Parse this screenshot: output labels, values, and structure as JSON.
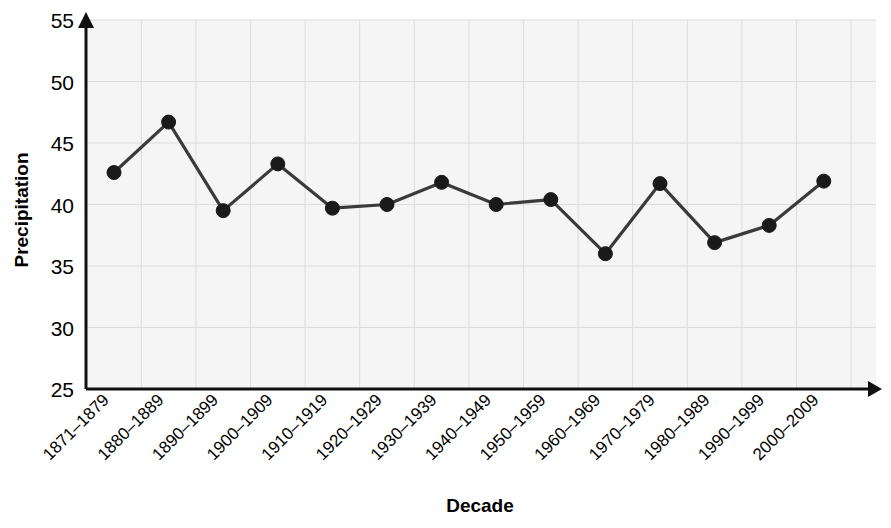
{
  "chart_data": {
    "type": "line",
    "title": "",
    "xlabel": "Decade",
    "ylabel": "Precipitation",
    "categories": [
      "1871–1879",
      "1880–1889",
      "1890–1899",
      "1900–1909",
      "1910–1919",
      "1920–1929",
      "1930–1939",
      "1940–1949",
      "1950–1959",
      "1960–1969",
      "1970–1979",
      "1980–1989",
      "1990–1999",
      "2000–2009"
    ],
    "values": [
      42.6,
      46.7,
      39.5,
      43.3,
      39.7,
      40.0,
      41.8,
      40.0,
      40.4,
      36.0,
      41.7,
      36.9,
      38.3,
      41.9
    ],
    "ylim": [
      25,
      55
    ],
    "yticks": [
      25,
      30,
      35,
      40,
      45,
      50,
      55
    ],
    "ytick_labels": [
      "25",
      "30",
      "35",
      "40",
      "45",
      "50",
      "55"
    ],
    "grid": true,
    "legend": "none",
    "series_name": "Precipitation",
    "colors": {
      "line": "#3a3a3a",
      "marker": "#1a1a1a",
      "axis": "#111111",
      "grid": "#dcdcdc",
      "plot_background": "#f5f5f5",
      "page_background": "#ffffff"
    }
  }
}
